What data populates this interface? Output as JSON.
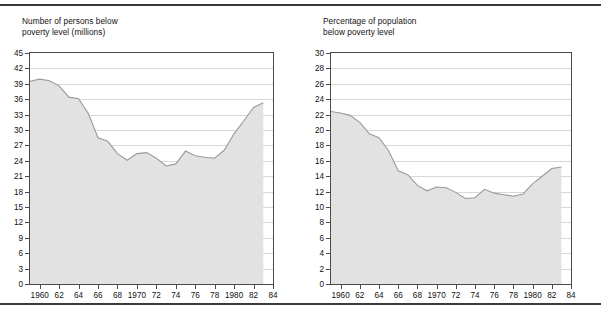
{
  "figure": {
    "has_top_rule": true,
    "has_bottom_rule": true,
    "fill_color": "#e2e2e2",
    "line_color": "#9a9a9a",
    "frame_color": "#4a4a4a",
    "grid_color": "#d8d8d8"
  },
  "chart_data": [
    {
      "type": "area",
      "title": "Number of persons below\npoverty level (millions)",
      "xlabel": "",
      "ylabel": "",
      "ylim": [
        0,
        45
      ],
      "xlim": [
        1959,
        1984
      ],
      "grid": true,
      "legend": "none",
      "yticks": [
        0,
        3,
        6,
        9,
        12,
        15,
        18,
        21,
        24,
        27,
        30,
        33,
        36,
        39,
        42,
        45
      ],
      "ytick_labels": [
        "0",
        "3",
        "6",
        "9",
        "12",
        "15",
        "18",
        "21",
        "24",
        "27",
        "30",
        "33",
        "36",
        "39",
        "42",
        "45"
      ],
      "xticks": [
        1960,
        1962,
        1964,
        1966,
        1968,
        1970,
        1972,
        1974,
        1976,
        1978,
        1980,
        1982,
        1984
      ],
      "xtick_labels": [
        "1960",
        "62",
        "64",
        "66",
        "68",
        "1970",
        "72",
        "74",
        "76",
        "78",
        "1980",
        "82",
        "84"
      ],
      "x": [
        1959,
        1960,
        1961,
        1962,
        1963,
        1964,
        1965,
        1966,
        1967,
        1968,
        1969,
        1970,
        1971,
        1972,
        1973,
        1974,
        1975,
        1976,
        1977,
        1978,
        1979,
        1980,
        1981,
        1982,
        1983
      ],
      "values": [
        39.5,
        39.9,
        39.6,
        38.6,
        36.4,
        36.1,
        33.2,
        28.5,
        27.8,
        25.4,
        24.1,
        25.4,
        25.6,
        24.5,
        23.0,
        23.4,
        25.9,
        25.0,
        24.7,
        24.5,
        26.1,
        29.3,
        31.8,
        34.4,
        35.3
      ]
    },
    {
      "type": "area",
      "title": "Percentage of population\nbelow poverty level",
      "xlabel": "",
      "ylabel": "",
      "ylim": [
        0,
        30
      ],
      "xlim": [
        1959,
        1984
      ],
      "grid": true,
      "legend": "none",
      "yticks": [
        0,
        2,
        4,
        6,
        8,
        10,
        12,
        14,
        16,
        18,
        20,
        22,
        24,
        26,
        28,
        30
      ],
      "ytick_labels": [
        "0",
        "2",
        "4",
        "6",
        "8",
        "10",
        "12",
        "14",
        "16",
        "18",
        "20",
        "22",
        "24",
        "26",
        "28",
        "30"
      ],
      "xticks": [
        1960,
        1962,
        1964,
        1966,
        1968,
        1970,
        1972,
        1974,
        1976,
        1978,
        1980,
        1982,
        1984
      ],
      "xtick_labels": [
        "1960",
        "62",
        "64",
        "66",
        "68",
        "1970",
        "72",
        "74",
        "76",
        "78",
        "1980",
        "82",
        "84"
      ],
      "x": [
        1959,
        1960,
        1961,
        1962,
        1963,
        1964,
        1965,
        1966,
        1967,
        1968,
        1969,
        1970,
        1971,
        1972,
        1973,
        1974,
        1975,
        1976,
        1977,
        1978,
        1979,
        1980,
        1981,
        1982,
        1983
      ],
      "values": [
        22.4,
        22.2,
        21.9,
        21.0,
        19.5,
        19.0,
        17.3,
        14.7,
        14.2,
        12.8,
        12.1,
        12.6,
        12.5,
        11.9,
        11.1,
        11.2,
        12.3,
        11.8,
        11.6,
        11.4,
        11.7,
        13.0,
        14.0,
        15.0,
        15.2
      ]
    }
  ]
}
